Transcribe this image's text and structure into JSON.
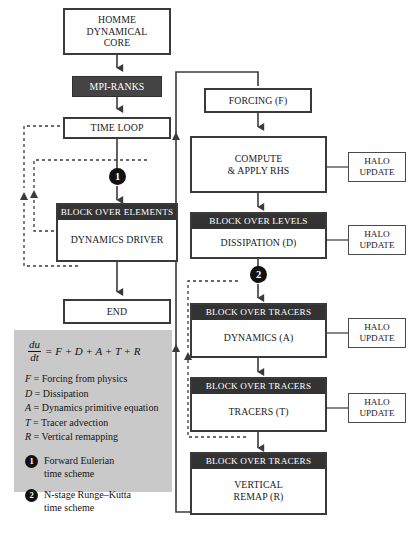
{
  "diagram": {
    "colors": {
      "box_border": "#3a3a3a",
      "header_fill": "#333333",
      "dark_fill": "#444444",
      "legend_fill": "#c9c9c9",
      "marker_fill": "#111111",
      "text": "#1a1a1a"
    }
  },
  "nodes": {
    "homme": {
      "lines": [
        "HOMME",
        "DYNAMICAL",
        "CORE"
      ]
    },
    "mpi_ranks": {
      "label": "MPI-RANKS"
    },
    "time_loop": {
      "label": "TIME LOOP"
    },
    "block_over_elements": {
      "header": "BLOCK OVER ELEMENTS",
      "label": "DYNAMICS DRIVER"
    },
    "end": {
      "label": "END"
    },
    "forcing": {
      "label": "FORCING (F)"
    },
    "compute_rhs": {
      "lines": [
        "COMPUTE",
        "& APPLY RHS"
      ]
    },
    "block_over_levels": {
      "header": "BLOCK OVER LEVELS",
      "label": "DISSIPATION (D)"
    },
    "block_over_tracers_a": {
      "header": "BLOCK OVER TRACERS",
      "label": "DYNAMICS (A)"
    },
    "block_over_tracers_t": {
      "header": "BLOCK OVER TRACERS",
      "label": "TRACERS (T)"
    },
    "block_over_tracers_r": {
      "header": "BLOCK OVER TRACERS",
      "lines": [
        "VERTICAL",
        "REMAP (R)"
      ]
    },
    "halo_update_1": {
      "lines": [
        "HALO",
        "UPDATE"
      ]
    },
    "halo_update_2": {
      "lines": [
        "HALO",
        "UPDATE"
      ]
    },
    "halo_update_3": {
      "lines": [
        "HALO",
        "UPDATE"
      ]
    },
    "halo_update_4": {
      "lines": [
        "HALO",
        "UPDATE"
      ]
    }
  },
  "markers": {
    "one": "1",
    "two": "2"
  },
  "legend": {
    "equation": {
      "numerator": "du",
      "denominator": "dt",
      "rhs": "= F + D + A + T + R"
    },
    "definitions": [
      {
        "symbol": "F",
        "text": "= Forcing from physics"
      },
      {
        "symbol": "D",
        "text": "= Dissipation"
      },
      {
        "symbol": "A",
        "text": "= Dynamics primitive equation"
      },
      {
        "symbol": "T",
        "text": "= Tracer advection"
      },
      {
        "symbol": "R",
        "text": "= Vertical remapping"
      }
    ],
    "schemes": [
      {
        "marker": "1",
        "lines": [
          "Forward Eulerian",
          "time scheme"
        ]
      },
      {
        "marker": "2",
        "lines": [
          "N-stage Runge–Kutta",
          "time scheme"
        ]
      }
    ]
  }
}
